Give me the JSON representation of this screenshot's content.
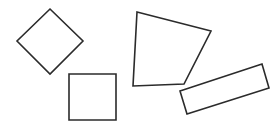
{
  "canvas": {
    "width": 277,
    "height": 129,
    "background": "#ffffff",
    "stroke_color": "#2b2b2b"
  },
  "shapes": [
    {
      "id": "diamond",
      "type": "square-rotated-45",
      "points": "50,9 83,41 50,74 17,41"
    },
    {
      "id": "square",
      "type": "square",
      "points": "69,74 116,74 116,120 69,120"
    },
    {
      "id": "quadrilateral",
      "type": "irregular-quadrilateral",
      "points": "137,12 211,31 184,84 133,86"
    },
    {
      "id": "rectangle",
      "type": "rotated-rectangle",
      "points": "180,91 262,64 269,88 187,114"
    }
  ]
}
